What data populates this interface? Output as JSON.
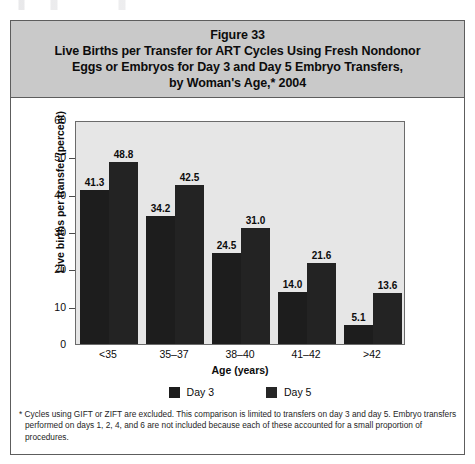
{
  "figure": {
    "title_lines": [
      "Figure 33",
      "Live Births per Transfer for ART Cycles Using Fresh Nondonor",
      "Eggs or Embryos for Day 3 and Day 5 Embryo Transfers,",
      "by Woman's Age,* 2004"
    ],
    "footnote": "* Cycles using GIFT or ZIFT are excluded. This comparison is limited to transfers on day 3 and day 5. Embryo transfers performed on days 1, 2, 4, and 6 are not included because each of these accounted for a small proportion of procedures.",
    "colors": {
      "title_band": "#c9c9c9",
      "plot_background": "#e6e6e6",
      "frame_border": "#5d5d5d",
      "day3_bar": "#1d1d1d",
      "day5_bar": "#232323"
    }
  },
  "chart_data": {
    "type": "bar",
    "title": "Live Births per Transfer for ART Cycles Using Fresh Nondonor Eggs or Embryos for Day 3 and Day 5 Embryo Transfers, by Woman's Age,* 2004",
    "subtitle": "Figure 33",
    "xlabel": "Age (years)",
    "ylabel": "Live births per transfer (percent)",
    "categories": [
      "<35",
      "35–37",
      "38–40",
      "41–42",
      ">42"
    ],
    "series": [
      {
        "name": "Day 3",
        "values": [
          41.3,
          34.2,
          24.5,
          14.0,
          5.1
        ]
      },
      {
        "name": "Day 5",
        "values": [
          48.8,
          42.5,
          31.0,
          21.6,
          13.6
        ]
      }
    ],
    "value_labels": [
      [
        "41.3",
        "48.8"
      ],
      [
        "34.2",
        "42.5"
      ],
      [
        "24.5",
        "31.0"
      ],
      [
        "14.0",
        "21.6"
      ],
      [
        "5.1",
        "13.6"
      ]
    ],
    "ylim": [
      0,
      60
    ],
    "ytick_values": [
      0,
      10,
      20,
      30,
      40,
      50,
      60
    ],
    "ytick_labels": [
      "0",
      "10",
      "20",
      "30",
      "40",
      "50",
      "60"
    ],
    "grid": false,
    "legend_position": "bottom",
    "legend_entries": [
      "Day 3",
      "Day 5"
    ]
  }
}
